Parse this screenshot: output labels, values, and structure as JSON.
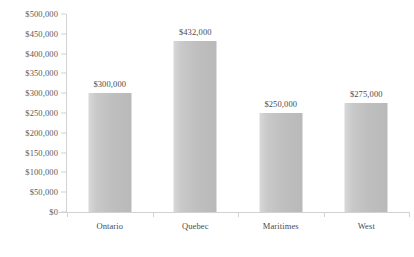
{
  "chart_data": {
    "type": "bar",
    "title": "",
    "subtitle": "",
    "xlabel": "",
    "ylabel": "",
    "categories": [
      "Ontario",
      "Quebec",
      "Maritimes",
      "West"
    ],
    "values": [
      300000,
      432000,
      250000,
      275000
    ],
    "data_labels": [
      "$300,000",
      "$432,000",
      "$250,000",
      "$275,000"
    ],
    "ylim": [
      0,
      500000
    ],
    "ytick_step": 50000,
    "ytick_labels": [
      "$500,000",
      "$450,000",
      "$400,000",
      "$350,000",
      "$300,000",
      "$250,000",
      "$200,000",
      "$150,000",
      "$100,000",
      "$50,000",
      "$0"
    ],
    "ytick_values": [
      500000,
      450000,
      400000,
      350000,
      300000,
      250000,
      200000,
      150000,
      100000,
      50000,
      0
    ],
    "grid": false,
    "legend": false,
    "legend_position": "none",
    "colors": {
      "bar_fill": "#c4c4c4",
      "bar_fill_light": "#d8d8d8",
      "bar_fill_dark": "#b9b9b9",
      "axis_line": "#d2d2d2",
      "tick_text": "#5a5a5a",
      "label_text": "#4a4a4a",
      "background": "#ffffff"
    }
  }
}
